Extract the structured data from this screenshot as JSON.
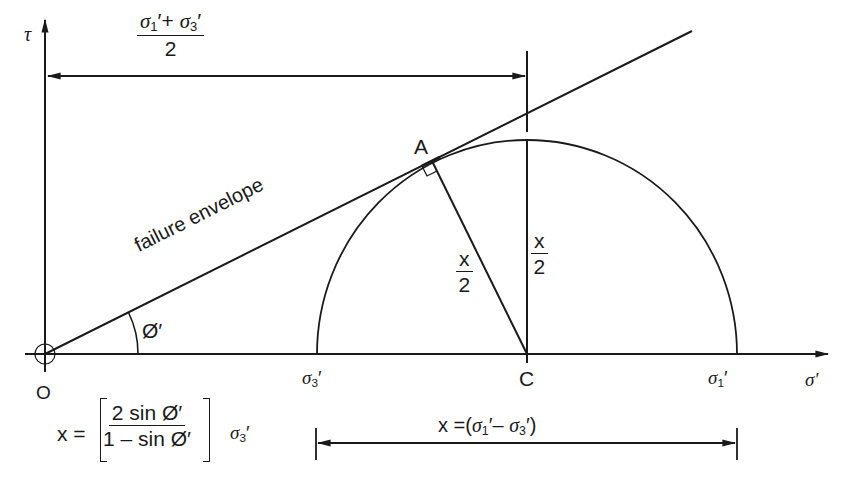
{
  "diagram": {
    "type": "Mohr circle with failure envelope",
    "axes": {
      "y_label": "τ",
      "x_label": "σ′",
      "origin_label": "O"
    },
    "points": {
      "tangent_point": "A",
      "centre": "C",
      "sigma3": {
        "sym": "σ",
        "sub": "3",
        "prime": "′"
      },
      "sigma1": {
        "sym": "σ",
        "sub": "1",
        "prime": "′"
      }
    },
    "envelope_label": "failure envelope",
    "angle_label": "Ø′",
    "top_dimension": {
      "num_a_sym": "σ",
      "num_a_sub": "1",
      "num_a_prime": "′",
      "plus": "+",
      "num_b_sym": "σ",
      "num_b_sub": "3",
      "num_b_prime": "′",
      "den": "2"
    },
    "radius_label_AC": {
      "num": "x",
      "den": "2"
    },
    "radius_label_vertical": {
      "num": "x",
      "den": "2"
    },
    "bottom_dimension": {
      "prefix": "x =(",
      "a_sym": "σ",
      "a_sub": "1",
      "a_prime": "′",
      "minus": "–",
      "b_sym": "σ",
      "b_sub": "3",
      "b_prime": "′",
      "suffix": ")"
    },
    "formula": {
      "lhs": "x =",
      "num": "2 sin Ø′",
      "den": "1 – sin Ø′",
      "factor_sym": "σ",
      "factor_sub": "3",
      "factor_prime": "′"
    },
    "colors": {
      "ink": "#1a1a1a",
      "background": "#ffffff"
    }
  }
}
